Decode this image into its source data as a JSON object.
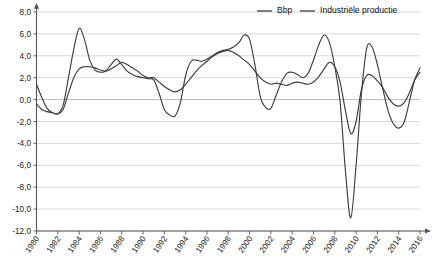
{
  "chart_data": {
    "type": "line",
    "title": "",
    "subtitle": "",
    "xlabel": "",
    "ylabel": "",
    "xlim": [
      1980,
      2016
    ],
    "ylim": [
      -12.0,
      8.0
    ],
    "grid": true,
    "legend_position": "top-right",
    "decimal_separator": ",",
    "y_ticks": [
      8.0,
      6.0,
      4.0,
      2.0,
      0.0,
      -2.0,
      -4.0,
      -6.0,
      -8.0,
      -10.0,
      -12.0
    ],
    "y_tick_labels": [
      "8,0",
      "6,0",
      "4,0",
      "2,0",
      "0,0",
      "-2,0",
      "-4,0",
      "-6,0",
      "-8,0",
      "-10,0",
      "-12,0"
    ],
    "x_ticks": [
      1980,
      1982,
      1984,
      1986,
      1988,
      1990,
      1992,
      1994,
      1996,
      1998,
      2000,
      2002,
      2004,
      2006,
      2008,
      2010,
      2012,
      2014,
      2016
    ],
    "x_tick_labels": [
      "1980",
      "1982",
      "1984",
      "1986",
      "1988",
      "1990",
      "1992",
      "1994",
      "1996",
      "1998",
      "2000",
      "2002",
      "2004",
      "2006",
      "2008",
      "2010",
      "2012",
      "2014",
      "2016"
    ],
    "series": [
      {
        "name": "Bbp",
        "color": "#3d3d3d",
        "x": [
          1980.0,
          1980.5,
          1981.0,
          1981.5,
          1982.0,
          1982.5,
          1983.0,
          1983.5,
          1984.0,
          1984.5,
          1985.0,
          1985.5,
          1986.0,
          1986.5,
          1987.0,
          1987.5,
          1988.0,
          1988.5,
          1989.0,
          1989.5,
          1990.0,
          1990.5,
          1991.0,
          1991.5,
          1992.0,
          1992.5,
          1993.0,
          1993.5,
          1994.0,
          1994.5,
          1995.0,
          1995.5,
          1996.0,
          1996.5,
          1997.0,
          1997.5,
          1998.0,
          1998.5,
          1999.0,
          1999.5,
          2000.0,
          2000.5,
          2001.0,
          2001.5,
          2002.0,
          2002.5,
          2003.0,
          2003.5,
          2004.0,
          2004.5,
          2005.0,
          2005.5,
          2006.0,
          2006.5,
          2007.0,
          2007.5,
          2008.0,
          2008.5,
          2009.0,
          2009.5,
          2010.0,
          2010.5,
          2011.0,
          2011.5,
          2012.0,
          2012.5,
          2013.0,
          2013.5,
          2014.0,
          2014.5,
          2015.0,
          2015.5,
          2016.0
        ],
        "values": [
          1.4,
          0.2,
          -0.8,
          -1.2,
          -1.3,
          -0.9,
          0.6,
          2.0,
          2.8,
          3.0,
          3.0,
          2.9,
          2.7,
          2.6,
          2.8,
          3.1,
          3.4,
          3.2,
          2.9,
          2.6,
          2.2,
          2.0,
          2.0,
          1.6,
          1.2,
          0.9,
          0.7,
          0.9,
          1.4,
          2.0,
          2.6,
          3.1,
          3.5,
          3.9,
          4.2,
          4.4,
          4.5,
          4.3,
          4.0,
          3.6,
          3.2,
          2.6,
          2.0,
          1.6,
          1.4,
          1.5,
          1.4,
          1.3,
          1.5,
          1.6,
          1.5,
          1.4,
          1.6,
          2.1,
          2.8,
          3.4,
          3.0,
          1.6,
          -1.0,
          -3.1,
          -2.0,
          0.9,
          2.2,
          2.2,
          1.7,
          1.1,
          0.2,
          -0.4,
          -0.6,
          -0.3,
          0.6,
          1.8,
          2.5
        ]
      },
      {
        "name": "Industriële productie",
        "color": "#3d3d3d",
        "x": [
          1980.0,
          1980.5,
          1981.0,
          1981.5,
          1982.0,
          1982.5,
          1983.0,
          1983.5,
          1984.0,
          1984.5,
          1985.0,
          1985.5,
          1986.0,
          1986.5,
          1987.0,
          1987.5,
          1988.0,
          1988.5,
          1989.0,
          1989.5,
          1990.0,
          1990.5,
          1991.0,
          1991.5,
          1992.0,
          1992.5,
          1993.0,
          1993.5,
          1994.0,
          1994.5,
          1995.0,
          1995.5,
          1996.0,
          1996.5,
          1997.0,
          1997.5,
          1998.0,
          1998.5,
          1999.0,
          1999.5,
          2000.0,
          2000.5,
          2001.0,
          2001.5,
          2002.0,
          2002.5,
          2003.0,
          2003.5,
          2004.0,
          2004.5,
          2005.0,
          2005.5,
          2006.0,
          2006.5,
          2007.0,
          2007.5,
          2008.0,
          2008.5,
          2009.0,
          2009.5,
          2010.0,
          2010.5,
          2011.0,
          2011.5,
          2012.0,
          2012.5,
          2013.0,
          2013.5,
          2014.0,
          2014.5,
          2015.0,
          2015.5,
          2016.0
        ],
        "values": [
          -0.4,
          -0.9,
          -1.1,
          -1.2,
          -1.3,
          -0.5,
          2.0,
          4.6,
          6.5,
          5.5,
          3.6,
          2.7,
          2.5,
          2.6,
          3.2,
          3.7,
          3.2,
          2.6,
          2.3,
          2.1,
          2.0,
          1.9,
          1.8,
          0.6,
          -0.9,
          -1.4,
          -1.5,
          -0.3,
          2.2,
          3.5,
          3.6,
          3.5,
          3.7,
          4.0,
          4.3,
          4.5,
          4.6,
          4.8,
          5.2,
          5.9,
          5.5,
          3.2,
          0.3,
          -0.7,
          -0.8,
          0.4,
          1.6,
          2.4,
          2.5,
          2.3,
          2.0,
          2.4,
          3.6,
          5.0,
          5.9,
          5.2,
          3.0,
          -0.2,
          -6.5,
          -10.8,
          -6.0,
          0.5,
          4.7,
          4.8,
          3.2,
          1.0,
          -1.0,
          -2.2,
          -2.6,
          -2.1,
          -0.2,
          1.8,
          2.9
        ]
      }
    ],
    "annotations": {
      "deepest_trough": {
        "year": 2009,
        "series": "Industriële productie",
        "value": -10.8
      },
      "highest_peak": {
        "year": 1999.5,
        "series": "Industriële productie",
        "value": 5.9
      }
    }
  },
  "legend": {
    "items": [
      {
        "label": "Bbp"
      },
      {
        "label": "Industriële productie"
      }
    ]
  }
}
